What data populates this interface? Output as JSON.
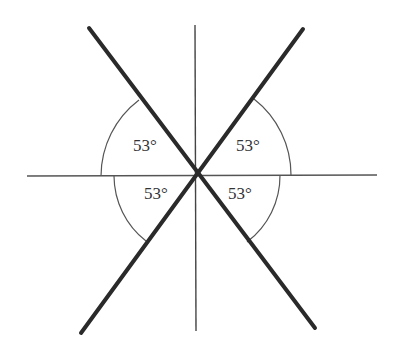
{
  "diagram": {
    "colors": {
      "thick_line": "#2a2a2a",
      "thin_line": "#444444",
      "text": "#333333",
      "background": "#ffffff"
    },
    "angle_labels": {
      "upper_left": "53°",
      "upper_right": "53°",
      "lower_left": "53°",
      "lower_right": "53°"
    }
  }
}
